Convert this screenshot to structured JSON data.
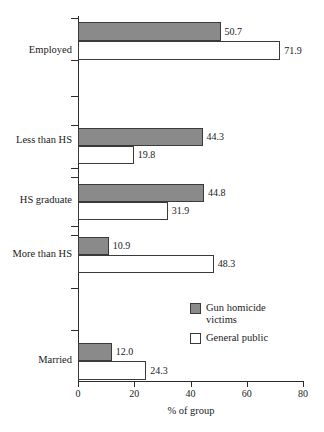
{
  "chart_data": {
    "type": "bar",
    "orientation": "horizontal",
    "title": "",
    "xlabel": "% of group",
    "ylabel": "",
    "xlim": [
      0,
      80
    ],
    "xticks": [
      0,
      20,
      40,
      60,
      80
    ],
    "xtick_labels": [
      "0",
      "20",
      "40",
      "60",
      "80"
    ],
    "grid": false,
    "legend_position": "inside-lower-right",
    "categories": [
      "Employed",
      "Less than HS",
      "HS graduate",
      "More than HS",
      "Married"
    ],
    "series": [
      {
        "name": "Gun homicide victims",
        "color": "#8a8a8a",
        "values": [
          50.7,
          44.3,
          44.8,
          10.9,
          12.0
        ],
        "value_labels": [
          "50.7",
          "44.3",
          "44.8",
          "10.9",
          "12.0"
        ]
      },
      {
        "name": "General public",
        "color": "#ffffff",
        "values": [
          71.9,
          19.8,
          31.9,
          48.3,
          24.3
        ],
        "value_labels": [
          "71.9",
          "19.8",
          "31.9",
          "48.3",
          "24.3"
        ]
      }
    ]
  },
  "legend": {
    "items": [
      {
        "label": "Gun homicide victims",
        "swatch": "filled-gray-square"
      },
      {
        "label": "General public",
        "swatch": "hollow-white-square"
      }
    ]
  },
  "layout": {
    "bars": [
      {
        "category": "Employed",
        "series": "Gun homicide victims",
        "top": 22,
        "height": 19,
        "value": 50.7
      },
      {
        "category": "Employed",
        "series": "General public",
        "top": 41,
        "height": 19,
        "value": 71.9
      },
      {
        "category": "Less than HS",
        "series": "Gun homicide victims",
        "top": 128,
        "height": 18,
        "value": 44.3
      },
      {
        "category": "Less than HS",
        "series": "General public",
        "top": 146,
        "height": 18,
        "value": 19.8
      },
      {
        "category": "HS graduate",
        "series": "Gun homicide victims",
        "top": 184,
        "height": 18,
        "value": 44.8
      },
      {
        "category": "HS graduate",
        "series": "General public",
        "top": 202,
        "height": 18,
        "value": 31.9
      },
      {
        "category": "More than HS",
        "series": "Gun homicide victims",
        "top": 237,
        "height": 18,
        "value": 10.9
      },
      {
        "category": "More than HS",
        "series": "General public",
        "top": 255,
        "height": 18,
        "value": 48.3
      },
      {
        "category": "Married",
        "series": "Gun homicide victims",
        "top": 343,
        "height": 18,
        "value": 12.0
      },
      {
        "category": "Married",
        "series": "General public",
        "top": 361,
        "height": 19,
        "value": 24.3
      }
    ],
    "category_label_tops": [
      44,
      134,
      194,
      248,
      354
    ],
    "ytick_tops": [
      18,
      60,
      96,
      125,
      168,
      177,
      226,
      235,
      288,
      330
    ]
  }
}
